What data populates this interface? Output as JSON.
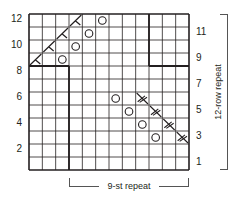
{
  "chart": {
    "columns": 12,
    "rows": 12,
    "row_labels_left": [
      "12",
      "10",
      "8",
      "6",
      "4",
      "2"
    ],
    "row_labels_right": [
      "11",
      "9",
      "7",
      "5",
      "3",
      "1"
    ],
    "row_repeat_label": "12-row repeat",
    "stitch_repeat_label": "9-st repeat",
    "symbols": [
      {
        "row": 12,
        "col": 4,
        "type": "left-decrease"
      },
      {
        "row": 12,
        "col": 6,
        "type": "yarn-over"
      },
      {
        "row": 11,
        "col": 3,
        "type": "left-decrease"
      },
      {
        "row": 11,
        "col": 5,
        "type": "yarn-over"
      },
      {
        "row": 10,
        "col": 2,
        "type": "left-decrease"
      },
      {
        "row": 10,
        "col": 4,
        "type": "yarn-over"
      },
      {
        "row": 9,
        "col": 1,
        "type": "left-decrease"
      },
      {
        "row": 9,
        "col": 3,
        "type": "yarn-over"
      },
      {
        "row": 6,
        "col": 7,
        "type": "yarn-over"
      },
      {
        "row": 6,
        "col": 9,
        "type": "right-decrease"
      },
      {
        "row": 5,
        "col": 8,
        "type": "yarn-over"
      },
      {
        "row": 5,
        "col": 10,
        "type": "right-decrease"
      },
      {
        "row": 4,
        "col": 9,
        "type": "yarn-over"
      },
      {
        "row": 4,
        "col": 11,
        "type": "right-decrease"
      },
      {
        "row": 3,
        "col": 10,
        "type": "yarn-over"
      },
      {
        "row": 3,
        "col": 12,
        "type": "right-decrease"
      }
    ],
    "colors": {
      "grid": "#231f20",
      "background": "#ffffff",
      "bracket": "#555555"
    }
  }
}
